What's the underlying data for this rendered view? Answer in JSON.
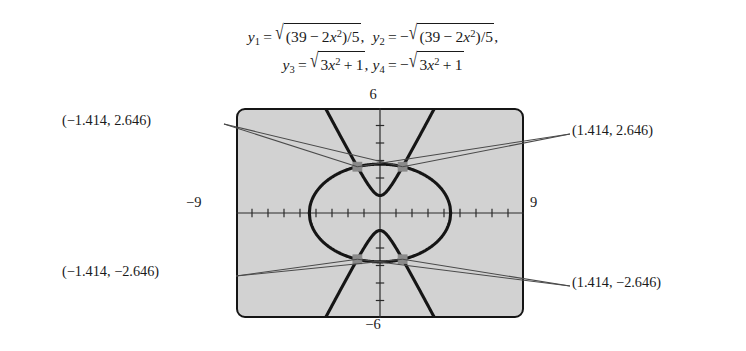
{
  "equations": {
    "line1": {
      "y1_label": "y",
      "y1_sub": "1",
      "eq": "=",
      "y1_expr_radicand": "(39 − 2x²)/5",
      "comma": ",",
      "y2_label": "y",
      "y2_sub": "2",
      "minus": "−",
      "y2_expr_radicand": "(39 − 2x²)/5",
      "plain": "y₁ = √((39 − 2x²)/5),  y₂ = −√((39 − 2x²)/5),"
    },
    "line2": {
      "y3_label": "y",
      "y3_sub": "3",
      "y3_expr_radicand": "3x² + 1",
      "y4_label": "y",
      "y4_sub": "4",
      "y4_expr_radicand": "3x² + 1",
      "plain": "y₃ = √(3x² + 1),  y₄ = −√(3x² + 1)"
    },
    "radical_sign": "√",
    "equals": "=",
    "minus_sign": "−",
    "comma": ",",
    "x_var": "x",
    "exp2": "2",
    "num_39": "39",
    "num_2": "2",
    "num_5": "5",
    "num_3": "3",
    "num_1": "1",
    "slash": "/",
    "paren_open": "(",
    "paren_close": ")",
    "plus": "+"
  },
  "graph": {
    "window": {
      "xmin_label": "−9",
      "xmax_label": "9",
      "ymin_label": "−6",
      "ymax_label": "6",
      "xmin": -9,
      "xmax": 9,
      "ymin": -6,
      "ymax": 6,
      "xscl": 1,
      "yscl": 1
    },
    "screen_fill": "#d2d2d2",
    "curve_color": "#151515",
    "point_color": "#8a8a8a",
    "leader_color": "#4a4a4a"
  },
  "callouts": [
    {
      "name": "top-left",
      "text": "(−1.414, 2.646)",
      "x": -1.414,
      "y": 2.646
    },
    {
      "name": "top-right",
      "text": "(1.414, 2.646)",
      "x": 1.414,
      "y": 2.646
    },
    {
      "name": "bottom-left",
      "text": "(−1.414, −2.646)",
      "x": -1.414,
      "y": -2.646
    },
    {
      "name": "bottom-right",
      "text": "(1.414, −2.646)",
      "x": 1.414,
      "y": -2.646
    }
  ],
  "chart_data": {
    "type": "line",
    "title": "",
    "xlabel": "",
    "ylabel": "",
    "xlim": [
      -9,
      9
    ],
    "ylim": [
      -6,
      6
    ],
    "grid": false,
    "legend": "none",
    "tick_spacing": {
      "x": 1,
      "y": 1
    },
    "series": [
      {
        "name": "y1 = sqrt((39 - 2x^2)/5)",
        "equation": "y = √((39 − 2x²)/5)",
        "kind": "ellipse-upper-half",
        "domain": [
          -4.416,
          4.416
        ],
        "points": [
          {
            "x": -4.416,
            "y": 0.0
          },
          {
            "x": -4.2,
            "y": 0.775
          },
          {
            "x": -4.0,
            "y": 1.058
          },
          {
            "x": -3.5,
            "y": 1.549
          },
          {
            "x": -3.0,
            "y": 1.908
          },
          {
            "x": -2.5,
            "y": 2.179
          },
          {
            "x": -2.0,
            "y": 2.385
          },
          {
            "x": -1.414,
            "y": 2.561
          },
          {
            "x": -1.0,
            "y": 2.642
          },
          {
            "x": 0.0,
            "y": 2.793
          },
          {
            "x": 1.0,
            "y": 2.642
          },
          {
            "x": 1.414,
            "y": 2.561
          },
          {
            "x": 2.0,
            "y": 2.385
          },
          {
            "x": 2.5,
            "y": 2.179
          },
          {
            "x": 3.0,
            "y": 1.908
          },
          {
            "x": 3.5,
            "y": 1.549
          },
          {
            "x": 4.0,
            "y": 1.058
          },
          {
            "x": 4.416,
            "y": 0.0
          }
        ]
      },
      {
        "name": "y2 = -sqrt((39 - 2x^2)/5)",
        "equation": "y = −√((39 − 2x²)/5)",
        "kind": "ellipse-lower-half",
        "domain": [
          -4.416,
          4.416
        ],
        "points": [
          {
            "x": -4.416,
            "y": 0.0
          },
          {
            "x": -4.0,
            "y": -1.058
          },
          {
            "x": -3.0,
            "y": -1.908
          },
          {
            "x": -2.0,
            "y": -2.385
          },
          {
            "x": -1.414,
            "y": -2.561
          },
          {
            "x": 0.0,
            "y": -2.793
          },
          {
            "x": 1.414,
            "y": -2.561
          },
          {
            "x": 2.0,
            "y": -2.385
          },
          {
            "x": 3.0,
            "y": -1.908
          },
          {
            "x": 4.0,
            "y": -1.058
          },
          {
            "x": 4.416,
            "y": 0.0
          }
        ]
      },
      {
        "name": "y3 = sqrt(3x^2 + 1)",
        "equation": "y = √(3x² + 1)",
        "kind": "hyperbola-upper-branch",
        "domain": [
          -3.2,
          3.2
        ],
        "points": [
          {
            "x": -3.2,
            "y": 5.639
          },
          {
            "x": -2.5,
            "y": 4.444
          },
          {
            "x": -2.0,
            "y": 3.606
          },
          {
            "x": -1.414,
            "y": 2.646
          },
          {
            "x": -1.0,
            "y": 2.0
          },
          {
            "x": -0.5,
            "y": 1.323
          },
          {
            "x": 0.0,
            "y": 1.0
          },
          {
            "x": 0.5,
            "y": 1.323
          },
          {
            "x": 1.0,
            "y": 2.0
          },
          {
            "x": 1.414,
            "y": 2.646
          },
          {
            "x": 2.0,
            "y": 3.606
          },
          {
            "x": 2.5,
            "y": 4.444
          },
          {
            "x": 3.2,
            "y": 5.639
          }
        ]
      },
      {
        "name": "y4 = -sqrt(3x^2 + 1)",
        "equation": "y = −√(3x² + 1)",
        "kind": "hyperbola-lower-branch",
        "domain": [
          -3.2,
          3.2
        ],
        "points": [
          {
            "x": -3.2,
            "y": -5.639
          },
          {
            "x": -2.0,
            "y": -3.606
          },
          {
            "x": -1.414,
            "y": -2.646
          },
          {
            "x": -1.0,
            "y": -2.0
          },
          {
            "x": 0.0,
            "y": -1.0
          },
          {
            "x": 1.0,
            "y": -2.0
          },
          {
            "x": 1.414,
            "y": -2.646
          },
          {
            "x": 2.0,
            "y": -3.606
          },
          {
            "x": 3.2,
            "y": -5.639
          }
        ]
      }
    ],
    "intersections": [
      {
        "x": -1.414,
        "y": 2.646,
        "label": "(−1.414, 2.646)"
      },
      {
        "x": 1.414,
        "y": 2.646,
        "label": "(1.414, 2.646)"
      },
      {
        "x": -1.414,
        "y": -2.646,
        "label": "(−1.414, −2.646)"
      },
      {
        "x": 1.414,
        "y": -2.646,
        "label": "(1.414, −2.646)"
      }
    ],
    "annotations": [
      "(−1.414, 2.646)",
      "(1.414, 2.646)",
      "(−1.414, −2.646)",
      "(1.414, −2.646)"
    ]
  }
}
